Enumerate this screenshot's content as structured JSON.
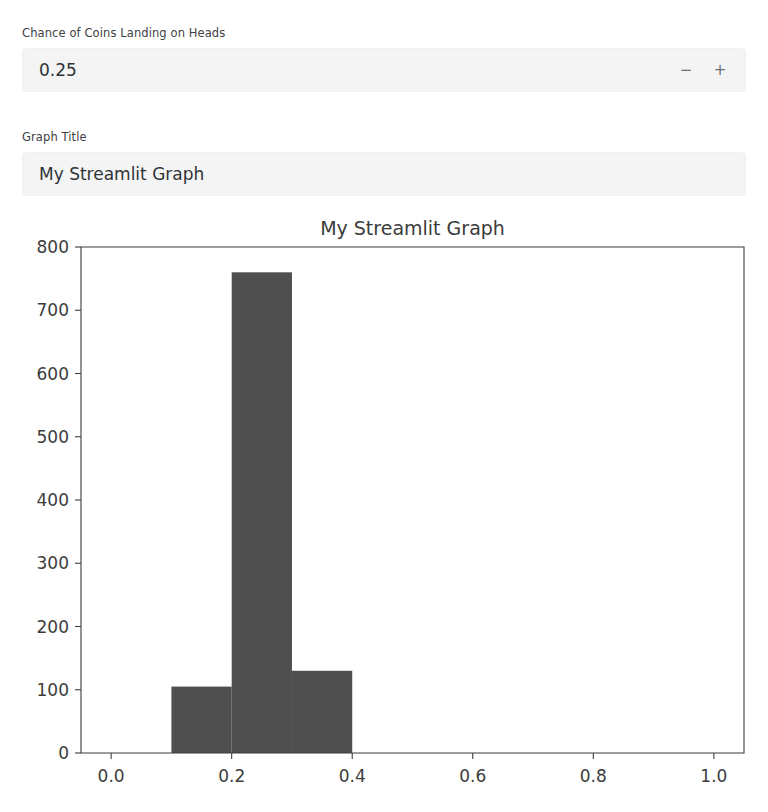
{
  "app": {
    "framework_name": "Streamlit"
  },
  "controls": {
    "number_input": {
      "label": "Chance of Coins Landing on Heads",
      "value": "0.25",
      "placeholder": "0.25",
      "decrement_label": "−",
      "increment_label": "+"
    },
    "text_input": {
      "label": "Graph Title",
      "value": "My Streamlit Graph",
      "placeholder": "My Streamlit Graph"
    }
  },
  "chart_data": {
    "type": "bar",
    "title": "My Streamlit Graph",
    "xlabel": "",
    "ylabel": "",
    "grid": false,
    "legend": null,
    "xlim": [
      -0.05,
      1.05
    ],
    "ylim": [
      0,
      800
    ],
    "xticks": [
      "0.0",
      "0.2",
      "0.4",
      "0.6",
      "0.8",
      "1.0"
    ],
    "xtick_values": [
      0.0,
      0.2,
      0.4,
      0.6,
      0.8,
      1.0
    ],
    "yticks": [
      "0",
      "100",
      "200",
      "300",
      "400",
      "500",
      "600",
      "700",
      "800"
    ],
    "ytick_values": [
      0,
      100,
      200,
      300,
      400,
      500,
      600,
      700,
      800
    ],
    "bar_color": "#4f4f4f",
    "bins": [
      {
        "x0": 0.1,
        "x1": 0.2,
        "value": 105
      },
      {
        "x0": 0.2,
        "x1": 0.3,
        "value": 760
      },
      {
        "x0": 0.3,
        "x1": 0.4,
        "value": 130
      }
    ]
  }
}
